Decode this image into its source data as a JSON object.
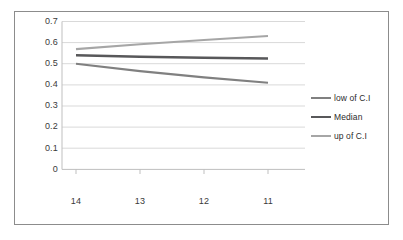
{
  "chart_data": {
    "type": "line",
    "title": "",
    "xlabel": "",
    "ylabel": "",
    "categories": [
      "14",
      "13",
      "12",
      "11"
    ],
    "x_tick_labels": [
      "14",
      "13",
      "12",
      "11"
    ],
    "y_tick_labels": [
      "0.7",
      "0.6",
      "0.5",
      "0.4",
      "0.3",
      "0.2",
      "0.1",
      "0"
    ],
    "y_tick_values": [
      0.7,
      0.6,
      0.5,
      0.4,
      0.3,
      0.2,
      0.1,
      0
    ],
    "ylim": [
      0,
      0.7
    ],
    "grid": "horizontal",
    "legend_position": "right",
    "series": [
      {
        "name": "low of C.I",
        "color": "#808080",
        "values": [
          0.5,
          0.465,
          0.435,
          0.41
        ]
      },
      {
        "name": "Median",
        "color": "#58585a",
        "values": [
          0.54,
          0.533,
          0.528,
          0.525
        ]
      },
      {
        "name": "up of C.I",
        "color": "#a6a6a6",
        "values": [
          0.57,
          0.593,
          0.613,
          0.632
        ]
      }
    ]
  },
  "legend": {
    "items": [
      {
        "label": "low of C.I"
      },
      {
        "label": "Median"
      },
      {
        "label": "up of C.I"
      }
    ]
  },
  "axes": {
    "y_labels": [
      "0.7",
      "0.6",
      "0.5",
      "0.4",
      "0.3",
      "0.2",
      "0.1",
      "0"
    ],
    "x_labels": [
      "14",
      "13",
      "12",
      "11"
    ]
  },
  "colors": {
    "frame_border": "#8c8c8c",
    "gridline": "#d9d9d9",
    "axis": "#bfbfbf",
    "tick_text": "#3a3a3a",
    "series_low": "#808080",
    "series_median": "#58585a",
    "series_up": "#a6a6a6"
  }
}
